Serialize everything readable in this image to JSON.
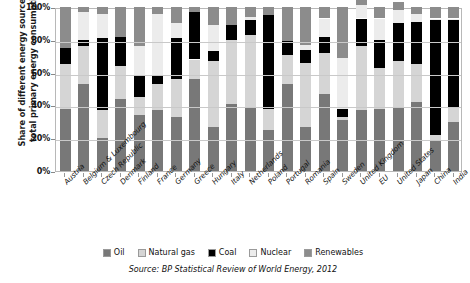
{
  "axis": {
    "y_title": "Share of different energy sources in total primary energy consumption",
    "y_ticks": [
      "100%",
      "80%",
      "60%",
      "40%",
      "20%",
      "0%"
    ]
  },
  "legend": {
    "items": [
      {
        "label": "Oil",
        "color": "#787878"
      },
      {
        "label": "Natural gas",
        "color": "#d5d5d5"
      },
      {
        "label": "Coal",
        "color": "#000000"
      },
      {
        "label": "Nuclear",
        "color": "#ececec"
      },
      {
        "label": "Renewables",
        "color": "#8c8c8c"
      }
    ]
  },
  "source": {
    "text": "Source: BP Statistical Review of World Energy, 2012"
  },
  "chart_data": {
    "type": "bar",
    "stacked": true,
    "title": "",
    "xlabel": "",
    "ylabel": "Share of different energy sources in total primary energy consumption",
    "ylim": [
      0,
      100
    ],
    "yticks": [
      0,
      20,
      40,
      60,
      80,
      100
    ],
    "grid": true,
    "legend_position": "bottom",
    "units": "percent",
    "categories": [
      "Austria",
      "Belgium & Luxembourg",
      "Czech Republic",
      "Denmark",
      "Finland",
      "France",
      "Germany",
      "Greece",
      "Hungary",
      "Italy",
      "Netherlands",
      "Poland",
      "Portugal",
      "Romania",
      "Spain",
      "Sweden",
      "United Kingdom",
      "EU",
      "United States",
      "Japan",
      "China",
      "India"
    ],
    "series": [
      {
        "name": "Oil",
        "color": "#787878",
        "values": [
          38,
          53,
          20,
          44,
          34,
          37,
          33,
          56,
          27,
          41,
          39,
          25,
          53,
          27,
          47,
          31,
          37,
          38,
          39,
          42,
          18,
          30
        ]
      },
      {
        "name": "Natural gas",
        "color": "#d5d5d5",
        "values": [
          27,
          23,
          17,
          20,
          11,
          16,
          23,
          12,
          40,
          39,
          44,
          13,
          18,
          39,
          25,
          2,
          39,
          25,
          28,
          23,
          4,
          9
        ]
      },
      {
        "name": "Coal",
        "color": "#000000",
        "values": [
          10,
          4,
          44,
          18,
          13,
          5,
          25,
          29,
          6,
          9,
          9,
          57,
          8,
          8,
          10,
          5,
          17,
          17,
          23,
          26,
          70,
          53
        ]
      },
      {
        "name": "Nuclear",
        "color": "#ececec",
        "values": [
          0,
          17,
          15,
          0,
          18,
          38,
          9,
          0,
          16,
          0,
          2,
          0,
          0,
          3,
          11,
          31,
          8,
          13,
          8,
          5,
          1,
          1
        ]
      },
      {
        "name": "Renewables",
        "color": "#8c8c8c",
        "values": [
          25,
          3,
          4,
          18,
          24,
          4,
          10,
          3,
          11,
          11,
          6,
          5,
          21,
          23,
          7,
          31,
          3,
          7,
          5,
          4,
          7,
          7
        ]
      }
    ]
  }
}
